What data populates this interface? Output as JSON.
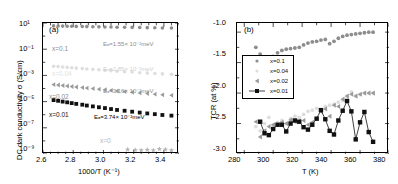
{
  "figure": {
    "panel_a_tag": "(a)",
    "panel_b_tag": "(b)"
  },
  "panel_a": {
    "ylabel": "DC dark conductivity σ (S/cm)",
    "xlabel": "1000/T (K⁻¹)",
    "ytick_labels": [
      "10¹",
      "10⁻¹",
      "10⁻³",
      "10⁻⁵",
      "10⁻⁷",
      "10⁻⁹"
    ],
    "xtick_labels": [
      "2.6",
      "2.8",
      "3.0",
      "3.2",
      "3.4"
    ],
    "series_labels": {
      "x01": "x=0.1",
      "x004": "x=0.04",
      "x002": "x=0.02",
      "x001": "x=0.01",
      "x0": "x=0"
    },
    "annotations": {
      "ea_x01": "Eₐ=1.55× 10⁻²meV",
      "ea_x004": "Eₐ=2.85× 10⁻²meV",
      "ea_x002": "Eₐ=3.16× 10⁻²meV",
      "ea_x001": "Eₐ=3.74× 10⁻²meV"
    }
  },
  "panel_b": {
    "ylabel": "TCR (at %)",
    "xlabel": "T (K)",
    "ytick_labels": [
      "-1.0",
      "-1.5",
      "-2.0",
      "-2.5",
      "-3.0"
    ],
    "xtick_labels": [
      "280",
      "300",
      "320",
      "340",
      "360",
      "380"
    ],
    "legend": [
      {
        "label": "x=0.1",
        "marker": "circle",
        "color": "#8d8d8d"
      },
      {
        "label": "x=0.04",
        "marker": "circle",
        "color": "#d8d8d8"
      },
      {
        "label": "x=0.02",
        "marker": "triangle",
        "color": "#9a9a9a"
      },
      {
        "label": "x=0.01",
        "marker": "square",
        "color": "#111111"
      }
    ]
  },
  "colors": {
    "x01": "#8d8d8d",
    "x004": "#dedede",
    "x002": "#9a9a9a",
    "x001": "#111111",
    "x0": "#b5b5b5",
    "axis": "#000000"
  },
  "chart_data": [
    {
      "type": "scatter",
      "id": "panel-a",
      "title": "(a)",
      "xlabel": "1000/T (K⁻¹)",
      "ylabel": "DC dark conductivity σ (S/cm)",
      "yscale": "log",
      "xlim": [
        2.6,
        3.5
      ],
      "ylim": [
        1e-09,
        10
      ],
      "grid": false,
      "legend_position": "inline-labels",
      "series": [
        {
          "name": "x=0.1",
          "marker": "circle",
          "color": "#8d8d8d",
          "x": [
            2.67,
            2.7,
            2.73,
            2.76,
            2.79,
            2.82,
            2.86,
            2.89,
            2.93,
            2.97,
            3.01,
            3.05,
            3.09,
            3.14,
            3.19,
            3.24,
            3.29,
            3.34,
            3.39,
            3.45
          ],
          "y": [
            6.0,
            5.9,
            5.8,
            5.7,
            5.6,
            5.5,
            5.4,
            5.3,
            5.2,
            5.1,
            5.0,
            4.9,
            4.8,
            4.7,
            4.6,
            4.5,
            4.4,
            4.3,
            4.2,
            4.1
          ]
        },
        {
          "name": "x=0.04",
          "marker": "circle",
          "color": "#dedede",
          "x": [
            2.67,
            2.7,
            2.73,
            2.76,
            2.79,
            2.82,
            2.86,
            2.89,
            2.93,
            2.97,
            3.01,
            3.05,
            3.09,
            3.14,
            3.19,
            3.24,
            3.29,
            3.34,
            3.39,
            3.45
          ],
          "y": [
            0.005,
            0.0047,
            0.0044,
            0.0041,
            0.0038,
            0.0036,
            0.0033,
            0.0031,
            0.0029,
            0.0027,
            0.0025,
            0.0023,
            0.0021,
            0.0019,
            0.0018,
            0.0016,
            0.0015,
            0.0014,
            0.0013,
            0.0012
          ]
        },
        {
          "name": "x=0.02",
          "marker": "triangle",
          "color": "#9a9a9a",
          "x": [
            2.67,
            2.7,
            2.73,
            2.76,
            2.79,
            2.82,
            2.86,
            2.89,
            2.93,
            2.97,
            3.01,
            3.05,
            3.09,
            3.14,
            3.19,
            3.24,
            3.29,
            3.34,
            3.39,
            3.45
          ],
          "y": [
            0.0002,
            0.000185,
            0.00017,
            0.000155,
            0.000142,
            0.00013,
            0.000118,
            0.000108,
            9.8e-05,
            8.9e-05,
            8e-05,
            7.2e-05,
            6.5e-05,
            5.8e-05,
            5.2e-05,
            4.6e-05,
            4.1e-05,
            3.7e-05,
            3.3e-05,
            3e-05
          ]
        },
        {
          "name": "x=0.01",
          "marker": "square",
          "color": "#111111",
          "x": [
            2.67,
            2.7,
            2.73,
            2.76,
            2.79,
            2.82,
            2.86,
            2.89,
            2.93,
            2.97,
            3.01,
            3.05,
            3.09,
            3.14,
            3.19,
            3.24,
            3.29,
            3.34,
            3.39,
            3.45
          ],
          "y": [
            1.3e-05,
            1.15e-05,
            1e-05,
            8.8e-06,
            7.7e-06,
            6.7e-06,
            5.8e-06,
            5e-06,
            4.3e-06,
            3.7e-06,
            3.2e-06,
            2.7e-06,
            2.3e-06,
            2e-06,
            1.7e-06,
            1.45e-06,
            1.25e-06,
            1.1e-06,
            9.5e-07,
            8.5e-07
          ]
        },
        {
          "name": "x=0",
          "marker": "star",
          "color": "#b5b5b5",
          "x": [
            3.16,
            3.21,
            3.25,
            3.29,
            3.33,
            3.37,
            3.41,
            3.45
          ],
          "y": [
            2.2e-09,
            2e-09,
            1.9e-09,
            2.1e-09,
            1.9e-09,
            2.4e-09,
            2.2e-09,
            1.9e-09
          ]
        }
      ],
      "annotations": [
        {
          "text": "Eₐ=1.55× 10⁻²meV",
          "x": 3.02,
          "y": 1.2
        },
        {
          "text": "Eₐ=2.85× 10⁻²meV",
          "x": 3.02,
          "y": 0.0009
        },
        {
          "text": "Eₐ=3.16× 10⁻²meV",
          "x": 3.02,
          "y": 2.2e-05
        },
        {
          "text": "Eₐ=3.74× 10⁻²meV",
          "x": 3.0,
          "y": 1.5e-07
        }
      ]
    },
    {
      "type": "scatter",
      "id": "panel-b",
      "title": "(b)",
      "xlabel": "T (K)",
      "ylabel": "TCR (at %)",
      "yscale": "linear",
      "xlim": [
        275,
        380
      ],
      "ylim": [
        -3.0,
        -0.85
      ],
      "grid": false,
      "legend_position": "left-middle",
      "series": [
        {
          "name": "x=0.1",
          "marker": "circle",
          "color": "#8d8d8d",
          "x": [
            288,
            291,
            294,
            297,
            300,
            303,
            306,
            309,
            312,
            315,
            318,
            321,
            324,
            327,
            330,
            333,
            336,
            339,
            342,
            345,
            348,
            351,
            354,
            357,
            360,
            363,
            366,
            369
          ],
          "y": [
            -1.25,
            -1.36,
            -1.41,
            -1.42,
            -1.4,
            -1.34,
            -1.3,
            -1.28,
            -1.27,
            -1.26,
            -1.25,
            -1.21,
            -1.18,
            -1.16,
            -1.15,
            -1.13,
            -1.12,
            -1.19,
            -1.15,
            -1.1,
            -1.07,
            -1.05,
            -1.04,
            -1.03,
            -1.02,
            -1.01,
            -1.0,
            -1.0
          ]
        },
        {
          "name": "x=0.04",
          "marker": "circle",
          "color": "#dedede",
          "x": [
            288,
            291,
            294,
            297,
            300,
            303,
            306,
            309,
            312,
            315,
            318,
            321,
            324,
            327,
            330,
            333,
            336,
            339,
            342,
            345,
            348,
            351,
            354,
            357,
            360,
            363,
            366,
            369
          ],
          "y": [
            -2.55,
            -2.62,
            -2.5,
            -2.4,
            -2.52,
            -2.48,
            -2.45,
            -2.5,
            -2.42,
            -2.38,
            -2.4,
            -2.35,
            -2.3,
            -2.28,
            -2.25,
            -2.3,
            -2.22,
            -2.2,
            -2.18,
            -2.15,
            -2.12,
            -2.05,
            -1.98,
            -2.05,
            -2.02,
            -2.0,
            -2.0,
            -2.0
          ]
        },
        {
          "name": "x=0.02",
          "marker": "triangle",
          "color": "#9a9a9a",
          "x": [
            288,
            291,
            294,
            297,
            300,
            303,
            306,
            309,
            312,
            315,
            318,
            321,
            324,
            327,
            330,
            333,
            336,
            339,
            342,
            345,
            348,
            351,
            354,
            357,
            360,
            363,
            366,
            369
          ],
          "y": [
            -2.47,
            -2.72,
            -2.62,
            -2.55,
            -2.52,
            -2.52,
            -2.48,
            -2.5,
            -2.44,
            -2.47,
            -2.46,
            -2.45,
            -2.52,
            -2.48,
            -2.42,
            -2.3,
            -2.26,
            -2.38,
            -2.2,
            -2.22,
            -2.1,
            -2.05,
            -2.02,
            -2.05,
            -2.02,
            -2.0,
            -2.0,
            -2.0
          ]
        },
        {
          "name": "x=0.01",
          "marker": "square",
          "color": "#111111",
          "x": [
            291,
            294,
            297,
            300,
            303,
            306,
            309,
            312,
            315,
            318,
            321,
            324,
            327,
            330,
            333,
            336,
            339,
            342,
            345,
            348,
            351,
            354,
            357,
            360,
            363,
            366,
            369
          ],
          "y": [
            -2.47,
            -2.66,
            -2.69,
            -2.59,
            -2.52,
            -2.52,
            -2.63,
            -2.5,
            -2.45,
            -2.47,
            -2.56,
            -2.6,
            -2.52,
            -2.42,
            -2.28,
            -2.43,
            -2.62,
            -2.68,
            -2.45,
            -2.29,
            -2.13,
            -2.3,
            -2.76,
            -2.48,
            -2.31,
            -2.64,
            -2.8
          ]
        }
      ]
    }
  ]
}
